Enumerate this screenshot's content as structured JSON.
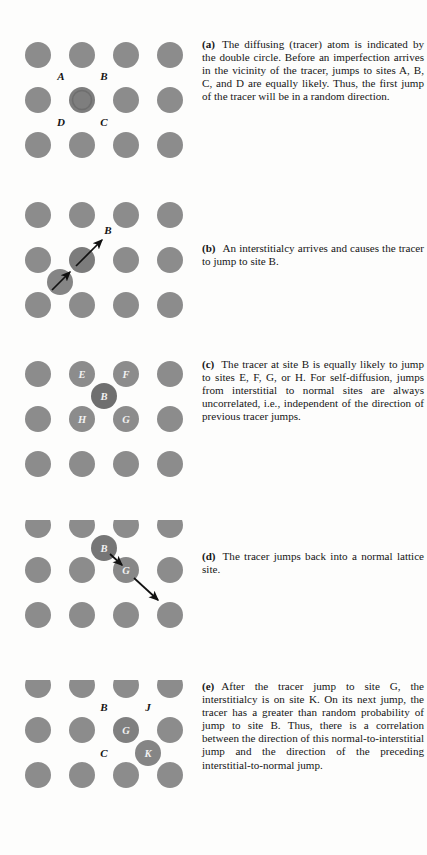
{
  "document": {
    "kind": "textbook-figure",
    "background_color": "#fdfdfc",
    "atom_color": "#8c8c8c",
    "tracer_color": "#7b7b7b",
    "interstitial_color": "#6f6f6f",
    "label_color": "#1a1a1a",
    "arrow_color": "#111111"
  },
  "panels": [
    {
      "id": "a",
      "tag": "(a)",
      "caption": "The diffusing (tracer) atom is indicated by the double circle. Before an imperfection arrives in the vicinity of the tracer, jumps to sites A, B, C, and D are equally likely. Thus, the first jump of the tracer will be in a random direction.",
      "site_labels": [
        "A",
        "B",
        "D",
        "C"
      ],
      "inside_labels": [],
      "arrows": 0
    },
    {
      "id": "b",
      "tag": "(b)",
      "caption": "An interstitialcy arrives and causes the tracer to jump to site B.",
      "site_labels": [
        "B"
      ],
      "inside_labels": [],
      "arrows": 2
    },
    {
      "id": "c",
      "tag": "(c)",
      "caption": "The tracer at site B is equally likely to jump to sites E, F, G, or H. For self-diffusion, jumps from interstitial to normal sites are always uncorrelated, i.e., independent of the direction of previous tracer jumps.",
      "site_labels": [],
      "inside_labels": [
        "E",
        "F",
        "B",
        "H",
        "G"
      ],
      "arrows": 0
    },
    {
      "id": "d",
      "tag": "(d)",
      "caption": "The tracer jumps back into a normal lattice site.",
      "site_labels": [],
      "inside_labels": [
        "B",
        "G"
      ],
      "arrows": 2
    },
    {
      "id": "e",
      "tag": "(e)",
      "caption": "After the tracer jump to site G, the interstitialcy is on site K. On its next jump, the tracer has a greater than random probability of jump to site B. Thus, there is a correlation between the direction of this normal-to-interstitial jump and the direction of the preceding interstitial-to-normal jump.",
      "site_labels": [
        "B",
        "J",
        "C"
      ],
      "inside_labels": [
        "G",
        "K"
      ],
      "arrows": 0
    }
  ]
}
